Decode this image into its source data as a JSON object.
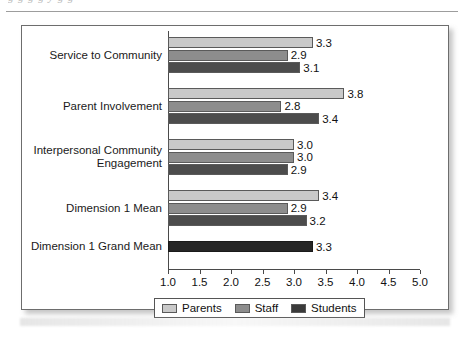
{
  "page": {
    "top_cut_text": "g   g   g   g        y  g g",
    "rule": "horizontal-rule"
  },
  "chart_data": {
    "type": "bar",
    "orientation": "horizontal",
    "title": "",
    "xlabel": "",
    "ylabel": "",
    "xlim": [
      1.0,
      5.0
    ],
    "xticks": [
      "1.0",
      "1.5",
      "2.0",
      "2.5",
      "3.0",
      "3.5",
      "4.0",
      "4.5",
      "5.0"
    ],
    "xtick_values": [
      1.0,
      1.5,
      2.0,
      2.5,
      3.0,
      3.5,
      4.0,
      4.5,
      5.0
    ],
    "grid": false,
    "legend_position": "bottom-center",
    "categories": [
      "Service to Community",
      "Parent Involvement",
      "Interpersonal Community\nEngagement",
      "Dimension 1 Mean",
      "Dimension 1 Grand Mean"
    ],
    "series": [
      {
        "name": "Parents",
        "color": "#c9c9c9",
        "values": [
          3.3,
          3.8,
          3.0,
          3.4,
          null
        ],
        "labels": [
          "3.3",
          "3.8",
          "3.0",
          "3.4",
          ""
        ]
      },
      {
        "name": "Staff",
        "color": "#8d8d8d",
        "values": [
          2.9,
          2.8,
          3.0,
          2.9,
          null
        ],
        "labels": [
          "2.9",
          "2.8",
          "3.0",
          "2.9",
          ""
        ]
      },
      {
        "name": "Students",
        "color": "#4c4c4c",
        "values": [
          3.1,
          3.4,
          2.9,
          3.2,
          null
        ],
        "labels": [
          "3.1",
          "3.4",
          "2.9",
          "3.2",
          ""
        ]
      },
      {
        "name": "Grand Mean",
        "color": "#262626",
        "values": [
          null,
          null,
          null,
          null,
          3.3
        ],
        "labels": [
          "",
          "",
          "",
          "",
          "3.3"
        ]
      }
    ],
    "legend": [
      {
        "label": "Parents",
        "color": "#c9c9c9"
      },
      {
        "label": "Staff",
        "color": "#8d8d8d"
      },
      {
        "label": "Students",
        "color": "#3a3a3a"
      }
    ]
  }
}
